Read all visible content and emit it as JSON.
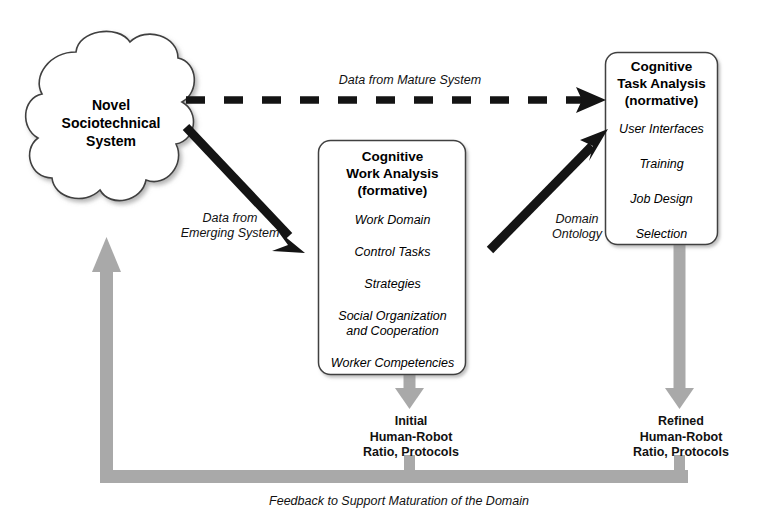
{
  "diagram": {
    "title_text": "Cognitive Work Analysis / Cognitive Task Analysis workflow",
    "colors": {
      "node_fill": "#ffffff",
      "node_stroke": "#3c3c3c",
      "gray_arrow": "#a6a6a6",
      "black_arrow": "#1a1a1a",
      "text": "#000000"
    },
    "cloud": {
      "label_line1": "Novel",
      "label_line2": "Sociotechnical",
      "label_line3": "System",
      "label_full": "Novel Sociotechnical System"
    },
    "cwa_box": {
      "title_line1": "Cognitive",
      "title_line2": "Work Analysis",
      "title_line3": "(formative)",
      "items": [
        "Work Domain",
        "Control Tasks",
        "Strategies",
        "Social Organization\nand Cooperation",
        "Worker Competencies"
      ],
      "item_social_line1": "Social Organization",
      "item_social_line2": "and Cooperation"
    },
    "cta_box": {
      "title_line1": "Cognitive",
      "title_line2": "Task Analysis",
      "title_line3": "(normative)",
      "items": [
        "User Interfaces",
        "Training",
        "Job Design",
        "Selection"
      ]
    },
    "edges": {
      "mature_label": "Data from Mature System",
      "emerging_label_line1": "Data from",
      "emerging_label_line2": "Emerging System",
      "ontology_label_line1": "Domain",
      "ontology_label_line2": "Ontology",
      "feedback_label": "Feedback to Support Maturation of the Domain"
    },
    "outputs": {
      "initial_line1": "Initial",
      "initial_line2": "Human-Robot",
      "initial_line3": "Ratio, Protocols",
      "refined_line1": "Refined",
      "refined_line2": "Human-Robot",
      "refined_line3": "Ratio, Protocols"
    }
  }
}
